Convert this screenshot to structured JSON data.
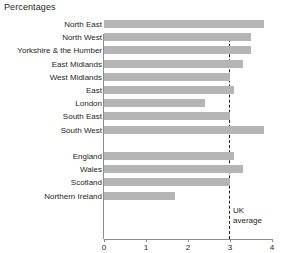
{
  "chart_data": {
    "type": "bar",
    "orientation": "horizontal",
    "title": "Percentages",
    "xlabel": "",
    "ylabel": "",
    "xlim": [
      0,
      4
    ],
    "xticks": [
      0,
      1,
      2,
      3,
      4
    ],
    "xtick_labels": [
      "0",
      "1",
      "2",
      "3",
      "4"
    ],
    "grid": false,
    "legend": null,
    "bar_color": "#b5b5b5",
    "axis_color": "#8d8d8d",
    "text_color": "#231f20",
    "categories": [
      "North East",
      "North West",
      "Yorkshire & the Humber",
      "East Midlands",
      "West Midlands",
      "East",
      "London",
      "South East",
      "South West",
      "",
      "England",
      "Wales",
      "Scotland",
      "Northern Ireland"
    ],
    "values": [
      3.8,
      3.5,
      3.5,
      3.3,
      3.0,
      3.1,
      2.4,
      3.0,
      3.8,
      null,
      3.1,
      3.3,
      3.0,
      1.7
    ],
    "annotations": [
      {
        "name": "uk-average",
        "label_line1": "UK",
        "label_line2": "average",
        "value": 3.0,
        "style": "dashed-vertical-line"
      }
    ],
    "group_break_after_index": 8
  }
}
